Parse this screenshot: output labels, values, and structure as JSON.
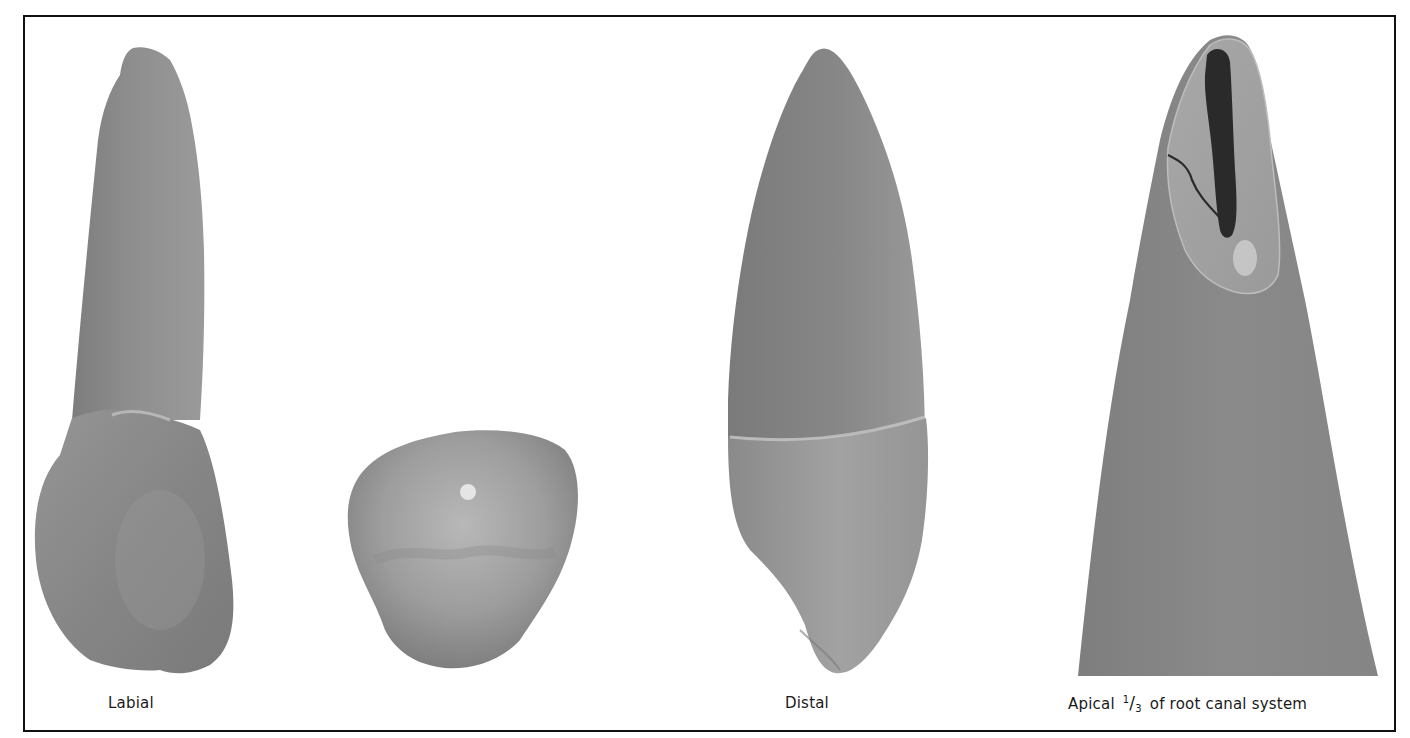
{
  "figure": {
    "panels": [
      {
        "id": "labial",
        "caption": "Labial",
        "description": "Tooth specimen, labial view (crown at bottom, root apex at top)"
      },
      {
        "id": "incisal",
        "caption": "",
        "description": "Tooth specimen, cross-sectional/occlusal view (triangular rounded outline)"
      },
      {
        "id": "distal",
        "caption": "Distal",
        "description": "Tooth specimen, distal view (crown at bottom, root apex at top)"
      },
      {
        "id": "apical",
        "caption_prefix": "Apical ",
        "caption_fraction_numerator": "1",
        "caption_fraction_slash": "/",
        "caption_fraction_denominator": "3",
        "caption_suffix": " of root canal system",
        "description": "Magnified root apex with cleared section showing dark root canal and lateral canal branch"
      }
    ],
    "colors": {
      "frame_border": "#111111",
      "background": "#ffffff",
      "tooth_dark": "#6e6e6e",
      "tooth_mid": "#8c8c8c",
      "tooth_light": "#b4b4b4",
      "canal": "#2c2c2c",
      "caption_text": "#1a1a1a"
    }
  }
}
